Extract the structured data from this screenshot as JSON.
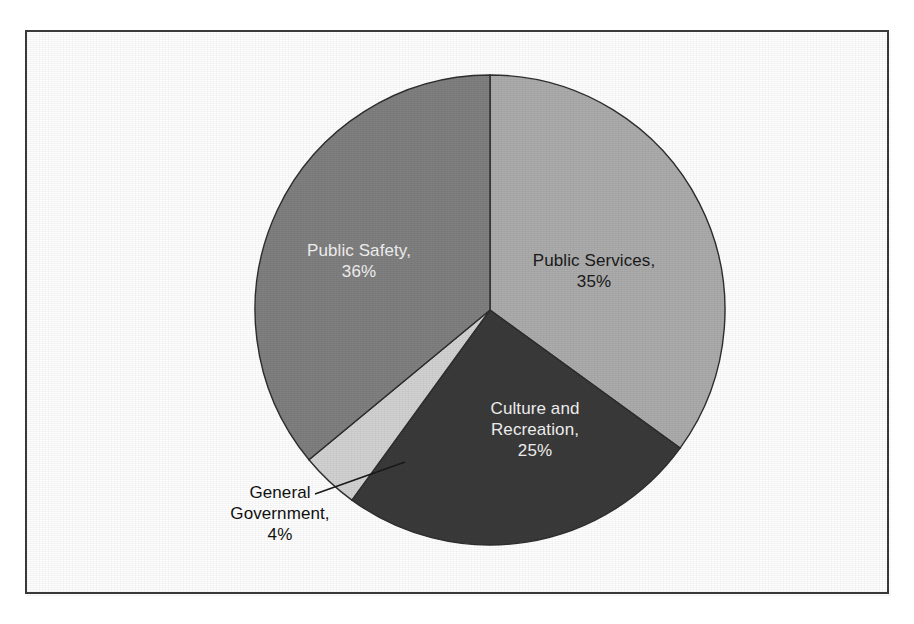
{
  "figure": {
    "background_color": "#ffffff",
    "border_color": "#3a3a3a",
    "has_title": false,
    "has_legend": false
  },
  "chart_data": {
    "type": "pie",
    "title": "",
    "subtitle": "",
    "xlabel": "",
    "ylabel": "",
    "labels": [
      "Public Services",
      "Culture and Recreation",
      "General Government",
      "Public Safety"
    ],
    "values": [
      35,
      25,
      4,
      36
    ],
    "value_unit": "%",
    "start_angle_deg": 90,
    "direction": "clockwise",
    "legend_position": "none",
    "grid": false,
    "slices": [
      {
        "name": "Public Services",
        "value": 35,
        "label_text": "Public Services,\n35%",
        "color": "#acacac",
        "label_placement": "inside",
        "label_color": "#1a1a1a",
        "leader_line": false
      },
      {
        "name": "Culture and Recreation",
        "value": 25,
        "label_text": "Culture and\nRecreation,\n25%",
        "color": "#3a3a3a",
        "label_placement": "inside",
        "label_color": "#f2f2f2",
        "leader_line": false
      },
      {
        "name": "General Government",
        "value": 4,
        "label_text": "General\nGovernment,\n4%",
        "color": "#d2d2d2",
        "label_placement": "outside",
        "label_color": "#111111",
        "leader_line": true
      },
      {
        "name": "Public Safety",
        "value": 36,
        "label_text": "Public Safety,\n36%",
        "color": "#808080",
        "label_placement": "inside",
        "label_color": "#f2f2f2",
        "leader_line": false
      }
    ]
  }
}
